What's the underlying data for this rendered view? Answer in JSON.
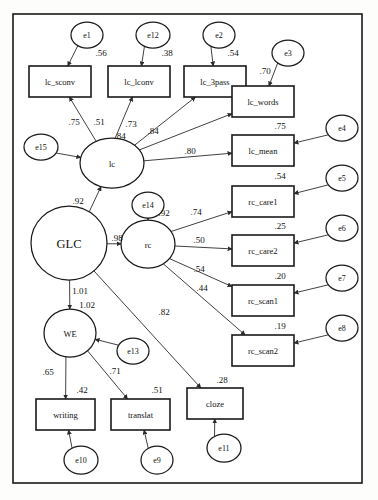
{
  "diagram": {
    "type": "sem-path-diagram",
    "title": "",
    "border": {
      "x": 13,
      "y": 14,
      "width": 349,
      "height": 469
    },
    "style": {
      "stroke": "#1a1a1a",
      "fill": "#ffffff",
      "background": "#fdfdfb"
    },
    "latents": [
      {
        "id": "GLC",
        "label": "GLC",
        "cx": 69,
        "cy": 243,
        "rx": 38,
        "ry": 37,
        "size": "big"
      },
      {
        "id": "lc",
        "label": "lc",
        "cx": 112,
        "cy": 163,
        "rx": 32,
        "ry": 25,
        "size": "med"
      },
      {
        "id": "rc",
        "label": "rc",
        "cx": 148,
        "cy": 244,
        "rx": 27,
        "ry": 24,
        "size": "med"
      },
      {
        "id": "WE",
        "label": "WE",
        "cx": 70,
        "cy": 333,
        "rx": 26,
        "ry": 24,
        "size": "med"
      }
    ],
    "observed": [
      {
        "id": "lc_sconv",
        "label": "lc_sconv",
        "x": 29,
        "y": 66,
        "width": 62,
        "height": 31
      },
      {
        "id": "lc_lconv",
        "label": "lc_lconv",
        "x": 108,
        "y": 66,
        "width": 62,
        "height": 31
      },
      {
        "id": "lc_3pass",
        "label": "lc_3pass",
        "x": 184,
        "y": 66,
        "width": 62,
        "height": 31
      },
      {
        "id": "lc_words",
        "label": "lc_words",
        "x": 232,
        "y": 86,
        "width": 62,
        "height": 31
      },
      {
        "id": "lc_mean",
        "label": "lc_mean",
        "x": 232,
        "y": 135,
        "width": 62,
        "height": 31
      },
      {
        "id": "rc_care1",
        "label": "rc_care1",
        "x": 232,
        "y": 186,
        "width": 62,
        "height": 31
      },
      {
        "id": "rc_care2",
        "label": "rc_care2",
        "x": 232,
        "y": 235,
        "width": 62,
        "height": 31
      },
      {
        "id": "rc_scan1",
        "label": "rc_scan1",
        "x": 232,
        "y": 285,
        "width": 62,
        "height": 31
      },
      {
        "id": "rc_scan2",
        "label": "rc_scan2",
        "x": 232,
        "y": 335,
        "width": 62,
        "height": 31
      },
      {
        "id": "writing",
        "label": "writing",
        "x": 36,
        "y": 399,
        "width": 59,
        "height": 31
      },
      {
        "id": "translat",
        "label": "translat",
        "x": 111,
        "y": 399,
        "width": 59,
        "height": 31
      },
      {
        "id": "cloze",
        "label": "cloze",
        "x": 187,
        "y": 388,
        "width": 56,
        "height": 31
      }
    ],
    "errors": [
      {
        "id": "e1",
        "label": "e1",
        "cx": 87,
        "cy": 35,
        "rx": 16,
        "ry": 13
      },
      {
        "id": "e12",
        "label": "e12",
        "cx": 153,
        "cy": 35,
        "rx": 17,
        "ry": 13
      },
      {
        "id": "e2",
        "label": "e2",
        "cx": 219,
        "cy": 35,
        "rx": 16,
        "ry": 13
      },
      {
        "id": "e3",
        "label": "e3",
        "cx": 288,
        "cy": 53,
        "rx": 16,
        "ry": 13
      },
      {
        "id": "e4",
        "label": "e4",
        "cx": 342,
        "cy": 128,
        "rx": 16,
        "ry": 13
      },
      {
        "id": "e5",
        "label": "e5",
        "cx": 342,
        "cy": 178,
        "rx": 16,
        "ry": 13
      },
      {
        "id": "e6",
        "label": "e6",
        "cx": 342,
        "cy": 228,
        "rx": 16,
        "ry": 13
      },
      {
        "id": "e7",
        "label": "e7",
        "cx": 342,
        "cy": 278,
        "rx": 16,
        "ry": 13
      },
      {
        "id": "e8",
        "label": "e8",
        "cx": 342,
        "cy": 328,
        "rx": 16,
        "ry": 13
      },
      {
        "id": "e15",
        "label": "e15",
        "cx": 41,
        "cy": 147,
        "rx": 17,
        "ry": 13
      },
      {
        "id": "e14",
        "label": "e14",
        "cx": 148,
        "cy": 205,
        "rx": 16,
        "ry": 13
      },
      {
        "id": "e13",
        "label": "e13",
        "cx": 133,
        "cy": 351,
        "rx": 16,
        "ry": 13
      },
      {
        "id": "e10",
        "label": "e10",
        "cx": 81,
        "cy": 460,
        "rx": 17,
        "ry": 14
      },
      {
        "id": "e9",
        "label": "e9",
        "cx": 157,
        "cy": 460,
        "rx": 16,
        "ry": 14
      },
      {
        "id": "e11",
        "label": "e11",
        "cx": 224,
        "cy": 448,
        "rx": 17,
        "ry": 14
      }
    ],
    "paths": [
      {
        "from": "e1",
        "to": "lc_sconv",
        "coef": ".56",
        "lx": 101,
        "ly": 53,
        "x1": 81,
        "y1": 48,
        "x2": 62,
        "y2": 64
      },
      {
        "from": "e12",
        "to": "lc_lconv",
        "coef": ".38",
        "lx": 167,
        "ly": 53,
        "x1": 147,
        "y1": 48,
        "x2": 131,
        "y2": 64
      },
      {
        "from": "e2",
        "to": "lc_3pass",
        "coef": ".54",
        "lx": 233,
        "ly": 53,
        "x1": 213,
        "y1": 48,
        "x2": 198,
        "y2": 64
      },
      {
        "from": "e3",
        "to": "lc_words",
        "coef": ".70",
        "lx": 265,
        "ly": 71,
        "x1": 280,
        "y1": 65,
        "x2": 256,
        "y2": 84
      },
      {
        "from": "e4",
        "to": "lc_mean",
        "coef": ".75",
        "lx": 280,
        "ly": 126,
        "x1": 327,
        "y1": 134,
        "x2": 296,
        "y2": 151
      },
      {
        "from": "e5",
        "to": "rc_care1",
        "coef": ".54",
        "lx": 280,
        "ly": 176,
        "x1": 327,
        "y1": 184,
        "x2": 296,
        "y2": 201
      },
      {
        "from": "e6",
        "to": "rc_care2",
        "coef": ".25",
        "lx": 280,
        "ly": 226,
        "x1": 327,
        "y1": 234,
        "x2": 296,
        "y2": 251
      },
      {
        "from": "e7",
        "to": "rc_scan1",
        "coef": ".20",
        "lx": 280,
        "ly": 276,
        "x1": 327,
        "y1": 284,
        "x2": 296,
        "y2": 301
      },
      {
        "from": "e8",
        "to": "rc_scan2",
        "coef": ".19",
        "lx": 280,
        "ly": 326,
        "x1": 327,
        "y1": 334,
        "x2": 296,
        "y2": 351
      },
      {
        "from": "e15",
        "to": "lc",
        "coef": "",
        "lx": 0,
        "ly": 0,
        "x1": 58,
        "y1": 152,
        "x2": 81,
        "y2": 163
      },
      {
        "from": "e14",
        "to": "rc",
        "coef": ".92",
        "lx": 164,
        "ly": 213,
        "x1": 148,
        "y1": 219,
        "x2": 148,
        "y2": 219
      },
      {
        "from": "e13",
        "to": "WE",
        "coef": "",
        "lx": 0,
        "ly": 0,
        "x1": 118,
        "y1": 345,
        "x2": 96,
        "y2": 336
      },
      {
        "from": "e10",
        "to": "writing",
        "coef": "",
        "lx": 0,
        "ly": 0,
        "x1": 72,
        "y1": 447,
        "x2": 60,
        "y2": 432
      },
      {
        "from": "e9",
        "to": "translat",
        "coef": "",
        "lx": 0,
        "ly": 0,
        "x1": 148,
        "y1": 447,
        "x2": 136,
        "y2": 432
      },
      {
        "from": "e11",
        "to": "cloze",
        "coef": "",
        "lx": 0,
        "ly": 0,
        "x1": 214,
        "y1": 436,
        "x2": 202,
        "y2": 421
      },
      {
        "from": "lc",
        "to": "lc_sconv",
        "coef": ".75",
        "lx": 74,
        "ly": 122,
        "x1": 97,
        "y1": 142,
        "x2": 66,
        "y2": 100
      },
      {
        "from": "lc",
        "to": "lc_lconv",
        "coef": ".51",
        "lx": 99,
        "ly": 122,
        "x1": 109,
        "y1": 138,
        "x2": 120,
        "y2": 100
      },
      {
        "from": "lc",
        "to": "lc_3pass",
        "coef": ".73",
        "lx": 131,
        "ly": 124,
        "x1": 127,
        "y1": 144,
        "x2": 192,
        "y2": 100
      },
      {
        "from": "lc",
        "to": "lc_words",
        "coef": ".84",
        "lx": 153,
        "ly": 131,
        "x1": 141,
        "y1": 155,
        "x2": 229,
        "y2": 107
      },
      {
        "from": "lc",
        "to": "lc_mean",
        "coef": ".80",
        "lx": 190,
        "ly": 151,
        "x1": 144,
        "y1": 166,
        "x2": 229,
        "y2": 155
      },
      {
        "from": "GLC",
        "to": "lc",
        "coef": ".92",
        "lx": 78,
        "ly": 201,
        "x1": 86,
        "y1": 212,
        "x2": 104,
        "y2": 189
      },
      {
        "from": "GLC",
        "to": "rc",
        "coef": ".98",
        "lx": 117,
        "ly": 238,
        "x1": 107,
        "y1": 243,
        "x2": 120,
        "y2": 244
      },
      {
        "from": "GLC",
        "to": "WE",
        "coef": "1.01",
        "lx": 80,
        "ly": 291,
        "x1": 70,
        "y1": 280,
        "x2": 70,
        "y2": 307
      },
      {
        "from": "GLC",
        "to": "cloze",
        "coef": ".82",
        "lx": 164,
        "ly": 312,
        "x1": 93,
        "y1": 271,
        "x2": 196,
        "y2": 385
      },
      {
        "from": "rc",
        "to": "rc_care1",
        "coef": ".74",
        "lx": 196,
        "ly": 212,
        "x1": 166,
        "y1": 228,
        "x2": 229,
        "y2": 200
      },
      {
        "from": "rc",
        "to": "rc_care2",
        "coef": ".50",
        "lx": 199,
        "ly": 240,
        "x1": 175,
        "y1": 243,
        "x2": 229,
        "y2": 250
      },
      {
        "from": "rc",
        "to": "rc_scan1",
        "coef": ".54",
        "lx": 199,
        "ly": 269,
        "x1": 169,
        "y1": 260,
        "x2": 229,
        "y2": 299
      },
      {
        "from": "rc",
        "to": "rc_scan2",
        "coef": ".44",
        "lx": 202,
        "ly": 288,
        "x1": 158,
        "y1": 267,
        "x2": 229,
        "y2": 349
      },
      {
        "from": "WE",
        "to": "writing",
        "coef": ".65",
        "lx": 48,
        "ly": 372,
        "x1": 66,
        "y1": 357,
        "x2": 59,
        "y2": 397
      },
      {
        "from": "WE",
        "to": "translat",
        "coef": ".71",
        "lx": 115,
        "ly": 371,
        "x1": 88,
        "y1": 349,
        "x2": 133,
        "y2": 397
      }
    ],
    "variance_labels": [
      {
        "value": "1.02",
        "x": 87,
        "y": 305
      },
      {
        "value": ".42",
        "x": 82,
        "y": 390
      },
      {
        "value": ".51",
        "x": 157,
        "y": 390
      },
      {
        "value": ".28",
        "x": 222,
        "y": 380
      },
      {
        "value": ".84",
        "x": 120,
        "y": 136
      }
    ]
  }
}
